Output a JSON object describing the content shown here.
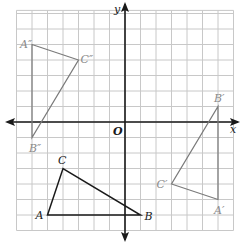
{
  "diagram": {
    "type": "coordinate-grid-transformations",
    "origin_px": [
      125,
      122
    ],
    "unit_px": 15.5,
    "grid": {
      "xmin": -7,
      "xmax": 7,
      "ymin": -7,
      "ymax": 7.2,
      "line_color": "#c8c8c8",
      "axis_color": "#1a1a1a"
    },
    "axes": {
      "x_label": "x",
      "y_label": "y",
      "origin_label": "O"
    },
    "shapes": [
      {
        "name": "triangle-abc",
        "color": "#1a1a1a",
        "label_color": "#1a1a1a",
        "vertices": [
          {
            "label": "A",
            "x": -5,
            "y": -6,
            "label_dx": -12,
            "label_dy": 4
          },
          {
            "label": "B",
            "x": 1,
            "y": -6,
            "label_dx": 4,
            "label_dy": 5
          },
          {
            "label": "C",
            "x": -4,
            "y": -3,
            "label_dx": -5,
            "label_dy": -5
          }
        ]
      },
      {
        "name": "triangle-a-prime",
        "color": "#7a7a7a",
        "label_color": "#8a8a8a",
        "vertices": [
          {
            "label": "A′",
            "x": 6,
            "y": -5,
            "label_dx": -4,
            "label_dy": 14
          },
          {
            "label": "B′",
            "x": 6,
            "y": 1,
            "label_dx": -4,
            "label_dy": -5
          },
          {
            "label": "C′",
            "x": 3,
            "y": -4,
            "label_dx": -15,
            "label_dy": 4
          }
        ]
      },
      {
        "name": "triangle-a-double-prime",
        "color": "#7a7a7a",
        "label_color": "#8a8a8a",
        "vertices": [
          {
            "label": "A″",
            "x": -6,
            "y": 5,
            "label_dx": -12,
            "label_dy": 3
          },
          {
            "label": "B″",
            "x": -6,
            "y": -1,
            "label_dx": -3,
            "label_dy": 14
          },
          {
            "label": "C″",
            "x": -3,
            "y": 4,
            "label_dx": 2,
            "label_dy": 3
          }
        ]
      }
    ]
  }
}
